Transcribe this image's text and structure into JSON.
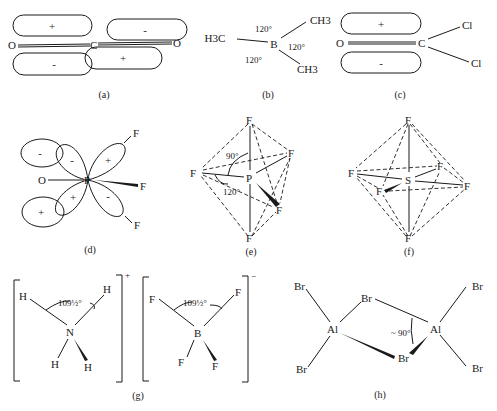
{
  "figure": {
    "panels": [
      {
        "caption": "(a)",
        "atoms": [
          "O",
          "C",
          "O"
        ],
        "lobes": [
          "+",
          "-",
          "-",
          "+"
        ]
      },
      {
        "caption": "(b)",
        "atoms": [
          "H3C",
          "B",
          "CH3",
          "CH3"
        ],
        "angles": [
          "120°",
          "120°",
          "120°"
        ]
      },
      {
        "caption": "(c)",
        "atoms": [
          "O",
          "C",
          "Cl",
          "Cl"
        ],
        "lobes": [
          "+",
          "-"
        ]
      },
      {
        "caption": "(d)",
        "atoms": [
          "O",
          "P",
          "F",
          "F",
          "F"
        ],
        "lobes": [
          "-",
          "-",
          "+",
          "+",
          "+",
          "-"
        ]
      },
      {
        "caption": "(e)",
        "atoms": [
          "F",
          "F",
          "P",
          "F",
          "F",
          "F"
        ],
        "angles": [
          "90°",
          "120°"
        ]
      },
      {
        "caption": "(f)",
        "atoms": [
          "F",
          "F",
          "F",
          "S",
          "F",
          "F",
          "F"
        ]
      },
      {
        "caption": "(g)",
        "left_ion": {
          "center": "N",
          "ligands": [
            "H",
            "H",
            "H",
            "H"
          ],
          "angle": "109½°",
          "charge": "+"
        },
        "right_ion": {
          "center": "B",
          "ligands": [
            "F",
            "F",
            "F",
            "F"
          ],
          "angle": "109½°",
          "charge": "−"
        }
      },
      {
        "caption": "(h)",
        "atoms": [
          "Br",
          "Br",
          "Al",
          "Al",
          "Br",
          "Br",
          "Br",
          "Br"
        ],
        "angle": "~ 90°"
      }
    ]
  }
}
